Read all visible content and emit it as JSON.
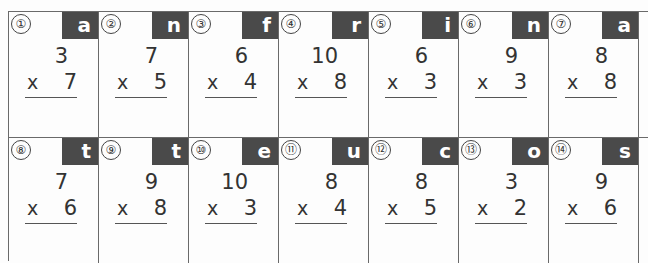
{
  "worksheet": {
    "operator": "x",
    "rows": [
      [
        {
          "number": "①",
          "letter": "a",
          "top": "3",
          "bottom": "7"
        },
        {
          "number": "②",
          "letter": "n",
          "top": "7",
          "bottom": "5"
        },
        {
          "number": "③",
          "letter": "f",
          "top": "6",
          "bottom": "4"
        },
        {
          "number": "④",
          "letter": "r",
          "top": "10",
          "bottom": "8"
        },
        {
          "number": "⑤",
          "letter": "i",
          "top": "6",
          "bottom": "3"
        },
        {
          "number": "⑥",
          "letter": "n",
          "top": "9",
          "bottom": "3"
        },
        {
          "number": "⑦",
          "letter": "a",
          "top": "8",
          "bottom": "8"
        }
      ],
      [
        {
          "number": "⑧",
          "letter": "t",
          "top": "7",
          "bottom": "6"
        },
        {
          "number": "⑨",
          "letter": "t",
          "top": "9",
          "bottom": "8"
        },
        {
          "number": "⑩",
          "letter": "e",
          "top": "10",
          "bottom": "3"
        },
        {
          "number": "⑪",
          "letter": "u",
          "top": "8",
          "bottom": "4"
        },
        {
          "number": "⑫",
          "letter": "c",
          "top": "8",
          "bottom": "5"
        },
        {
          "number": "⑬",
          "letter": "o",
          "top": "3",
          "bottom": "2"
        },
        {
          "number": "⑭",
          "letter": "s",
          "top": "9",
          "bottom": "6"
        }
      ]
    ]
  }
}
